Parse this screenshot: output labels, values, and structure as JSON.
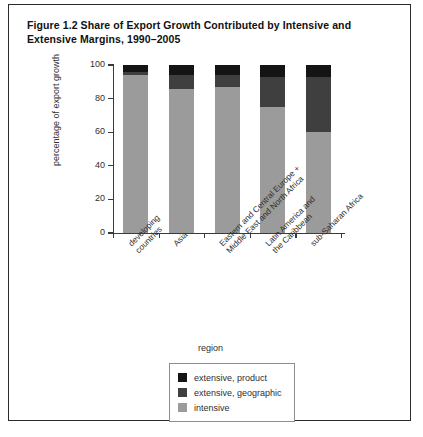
{
  "figure": {
    "title": "Figure 1.2  Share of Export Growth Contributed by Intensive and Extensive Margins, 1990–2005"
  },
  "chart_data": {
    "type": "bar",
    "stacked": true,
    "title": "Figure 1.2  Share of Export Growth Contributed by Intensive and Extensive Margins, 1990–2005",
    "xlabel": "region",
    "ylabel": "percentage of export growth",
    "ylim": [
      0,
      100
    ],
    "yticks": [
      0,
      20,
      40,
      60,
      80,
      100
    ],
    "ytick_labels": [
      "0",
      "20",
      "40",
      "60",
      "80",
      "100"
    ],
    "grid": false,
    "legend_position": "bottom",
    "categories": [
      "developing\ncountries",
      "Asia",
      "Eastern and Central Europe +\nMiddle East and North Africa",
      "Latin America and\nthe Caribbean",
      "sub-Saharan Africa"
    ],
    "category_labels": [
      [
        "developing",
        "countries"
      ],
      [
        "Asia"
      ],
      [
        "Eastern and Central Europe +",
        "Middle East and North Africa"
      ],
      [
        "Latin America and",
        "the Caribbean"
      ],
      [
        "sub-Saharan Africa"
      ]
    ],
    "series": [
      {
        "name": "intensive",
        "color": "#9b9b9b",
        "values": [
          94,
          86,
          87,
          75,
          60
        ]
      },
      {
        "name": "extensive, geographic",
        "color": "#3f3f3f",
        "values": [
          2,
          8,
          7,
          18,
          33
        ]
      },
      {
        "name": "extensive, product",
        "color": "#141414",
        "values": [
          4,
          6,
          6,
          7,
          7
        ]
      }
    ]
  },
  "legend": {
    "items": [
      {
        "label": "extensive, product",
        "color": "#141414"
      },
      {
        "label": "extensive, geographic",
        "color": "#3f3f3f"
      },
      {
        "label": "intensive",
        "color": "#9b9b9b"
      }
    ]
  }
}
